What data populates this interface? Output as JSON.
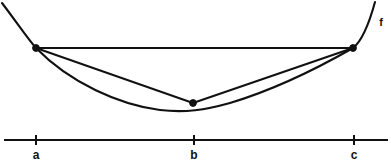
{
  "figure": {
    "background_color": "#ffffff",
    "ink_color": "#111111",
    "width": 391,
    "height": 165
  },
  "curve": {
    "name_label": "f",
    "name_x": 381,
    "name_y": 17,
    "description": "convex (upward-opening) curve",
    "path": "M 2,3 C 18,24 27,38 36,48 C 70,83 120,105 160,110 C 185,113 205,110 230,103 C 280,88 325,64 353,48 C 362,41 369,24 375,2",
    "stroke_width": 2.1
  },
  "chords": [
    {
      "name": "chord-a-c",
      "from": "a",
      "to": "c",
      "x1": 36,
      "y1": 48,
      "x2": 353,
      "y2": 48
    },
    {
      "name": "chord-a-b",
      "from": "a",
      "to": "b",
      "x1": 36,
      "y1": 48,
      "x2": 193,
      "y2": 103
    },
    {
      "name": "chord-b-c",
      "from": "b",
      "to": "c",
      "x1": 193,
      "y1": 103,
      "x2": 353,
      "y2": 48
    }
  ],
  "points": [
    {
      "label": "a",
      "x": 36,
      "y": 48,
      "radius": 3.4
    },
    {
      "label": "b",
      "x": 193,
      "y": 103,
      "radius": 3.4
    },
    {
      "label": "c",
      "x": 353,
      "y": 48,
      "radius": 3.4
    }
  ],
  "axis": {
    "name": "x-axis",
    "y": 140,
    "x_start": 4,
    "x_end": 388,
    "tick_half_height": 5,
    "ticks": [
      {
        "label": "a",
        "x": 36,
        "label_y": 149
      },
      {
        "label": "b",
        "x": 194,
        "label_y": 149
      },
      {
        "label": "c",
        "x": 354,
        "label_y": 149
      }
    ]
  },
  "chart_data": {
    "type": "line",
    "xlabel": "",
    "ylabel": "",
    "grid": false,
    "legend": null,
    "annotations": [
      "f"
    ],
    "tick_labels": [
      "a",
      "b",
      "c"
    ],
    "series": [
      {
        "name": "f",
        "kind": "curve",
        "points_px": [
          [
            2,
            3
          ],
          [
            36,
            48
          ],
          [
            80,
            88
          ],
          [
            120,
            101
          ],
          [
            160,
            110
          ],
          [
            193,
            111
          ],
          [
            205,
            110
          ],
          [
            230,
            103
          ],
          [
            280,
            88
          ],
          [
            320,
            67
          ],
          [
            353,
            48
          ],
          [
            375,
            2
          ]
        ]
      },
      {
        "name": "chord a-c",
        "kind": "segment",
        "points_px": [
          [
            36,
            48
          ],
          [
            353,
            48
          ]
        ]
      },
      {
        "name": "chord a-b",
        "kind": "segment",
        "points_px": [
          [
            36,
            48
          ],
          [
            193,
            103
          ]
        ]
      },
      {
        "name": "chord b-c",
        "kind": "segment",
        "points_px": [
          [
            193,
            103
          ],
          [
            353,
            48
          ]
        ]
      }
    ],
    "marked_points": [
      {
        "name": "a",
        "x_px": 36,
        "y_px": 48
      },
      {
        "name": "b",
        "x_px": 193,
        "y_px": 103
      },
      {
        "name": "c",
        "x_px": 353,
        "y_px": 48
      }
    ]
  }
}
